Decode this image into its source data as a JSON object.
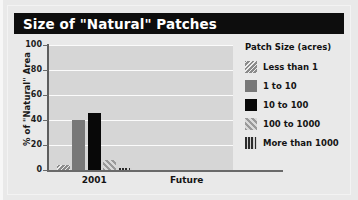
{
  "figure": {
    "title": "Size of \"Natural\" Patches"
  },
  "legend": {
    "title": "Patch Size (acres)",
    "items": [
      {
        "label": "Less than 1",
        "swatch": "hatch-back-gray-swatch"
      },
      {
        "label": "1 to 10",
        "swatch": "solid-gray-swatch"
      },
      {
        "label": "10 to 100",
        "swatch": "solid-black-swatch"
      },
      {
        "label": "100 to 1000",
        "swatch": "diagonal-stripe-swatch"
      },
      {
        "label": "More than 1000",
        "swatch": "vertical-stripe-swatch"
      }
    ]
  },
  "chart_data": {
    "type": "bar",
    "title": "Size of \"Natural\" Patches",
    "xlabel": "",
    "ylabel": "% of \"Natural\" Area",
    "categories": [
      "2001",
      "Future"
    ],
    "ylim": [
      0,
      100
    ],
    "yticks": [
      0,
      20,
      40,
      60,
      80,
      100
    ],
    "ytick_labels": [
      "0",
      "20",
      "40",
      "60",
      "80",
      "100"
    ],
    "grid": true,
    "legend_position": "right",
    "legend_title": "Patch Size (acres)",
    "series": [
      {
        "name": "Less than 1",
        "values": [
          4,
          0
        ]
      },
      {
        "name": "1 to 10",
        "values": [
          40,
          0
        ]
      },
      {
        "name": "10 to 100",
        "values": [
          46,
          0
        ]
      },
      {
        "name": "100 to 1000",
        "values": [
          8,
          0
        ]
      },
      {
        "name": "More than 1000",
        "values": [
          2,
          0
        ]
      }
    ]
  },
  "colors": {
    "title_bar": "#0d0d0d",
    "title_text": "#ffffff",
    "plot_background": "#d6d6d6",
    "gridline": "#fbfbfb",
    "axis": "#6a6a6a",
    "figure_background": "#e9e9e9"
  }
}
